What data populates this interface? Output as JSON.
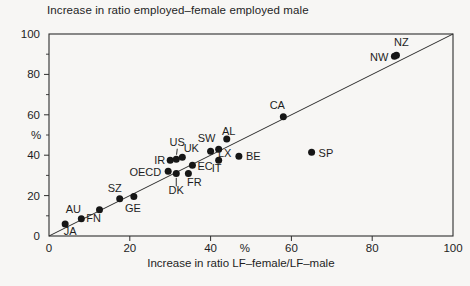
{
  "colors": {
    "ink": "#2e2e2e",
    "dot": "#161616",
    "background": "#f7f6f4"
  },
  "chart_data": {
    "type": "scatter",
    "title": "Increase in ratio employed–female employed male",
    "xlabel": "Increase in ratio LF–female/LF–male",
    "ylabel": "%",
    "x_unit_label": "%",
    "xlim": [
      0,
      100
    ],
    "ylim": [
      0,
      100
    ],
    "x_ticks": [
      0,
      20,
      40,
      60,
      80,
      100
    ],
    "y_ticks": [
      0,
      20,
      40,
      60,
      80,
      100
    ],
    "y_minor_ticks": [
      10,
      30,
      50,
      70,
      90
    ],
    "grid": false,
    "diagonal_line": {
      "from": [
        0,
        0
      ],
      "to": [
        100,
        100
      ]
    },
    "points": [
      {
        "id": "JA",
        "x": 4,
        "y": 6,
        "label": {
          "dx": 5,
          "dy": 11,
          "anchor": "middle"
        }
      },
      {
        "id": "AU",
        "x": 8,
        "y": 8.5,
        "label": {
          "dx": -8,
          "dy": -6,
          "anchor": "middle"
        }
      },
      {
        "id": "FN",
        "x": 12.5,
        "y": 13,
        "label": {
          "dx": -6,
          "dy": 12,
          "anchor": "middle"
        }
      },
      {
        "id": "SZ",
        "x": 17.5,
        "y": 18.5,
        "label": {
          "dx": -5,
          "dy": -7,
          "anchor": "middle"
        }
      },
      {
        "id": "GE",
        "x": 21,
        "y": 19.5,
        "label": {
          "dx": -1,
          "dy": 15,
          "anchor": "middle"
        }
      },
      {
        "id": "OECD",
        "x": 29.5,
        "y": 32,
        "label": {
          "dx": -7,
          "dy": 5,
          "anchor": "end"
        }
      },
      {
        "id": "IR",
        "x": 30,
        "y": 37.5,
        "label": {
          "dx": -5,
          "dy": 4,
          "anchor": "end"
        }
      },
      {
        "id": "US",
        "x": 31.5,
        "y": 38,
        "label": {
          "dx": 1,
          "dy": -13,
          "anchor": "middle"
        },
        "leader": {
          "x1": 1,
          "y1": -10.5,
          "x2": 0.3,
          "y2": -4.5
        }
      },
      {
        "id": "UK",
        "x": 33,
        "y": 39,
        "label": {
          "dx": 9,
          "dy": -5,
          "anchor": "middle"
        }
      },
      {
        "id": "DK",
        "x": 31.5,
        "y": 31,
        "label": {
          "dx": 0,
          "dy": 21,
          "anchor": "middle"
        },
        "leader": {
          "x1": 0,
          "y1": 4.5,
          "x2": 0,
          "y2": 13
        }
      },
      {
        "id": "FR",
        "x": 34.5,
        "y": 31,
        "label": {
          "dx": 6,
          "dy": 13,
          "anchor": "middle"
        }
      },
      {
        "id": "EC",
        "x": 35.5,
        "y": 35,
        "label": {
          "dx": 5,
          "dy": 5,
          "anchor": "start"
        }
      },
      {
        "id": "SW",
        "x": 40,
        "y": 42,
        "label": {
          "dx": -4,
          "dy": -9,
          "anchor": "middle"
        }
      },
      {
        "id": "LX",
        "x": 42,
        "y": 43,
        "label": {
          "dx": 6,
          "dy": 8,
          "anchor": "middle"
        }
      },
      {
        "id": "IT",
        "x": 42,
        "y": 37.5,
        "label": {
          "dx": -2,
          "dy": 12,
          "anchor": "middle"
        }
      },
      {
        "id": "AL",
        "x": 44,
        "y": 48,
        "label": {
          "dx": 2,
          "dy": -4,
          "anchor": "middle"
        }
      },
      {
        "id": "BE",
        "x": 47,
        "y": 39.5,
        "label": {
          "dx": 7,
          "dy": 4,
          "anchor": "start"
        }
      },
      {
        "id": "CA",
        "x": 58,
        "y": 59,
        "label": {
          "dx": -6,
          "dy": -8,
          "anchor": "middle"
        }
      },
      {
        "id": "SP",
        "x": 65,
        "y": 41.5,
        "label": {
          "dx": 7,
          "dy": 5,
          "anchor": "start"
        }
      },
      {
        "id": "NW",
        "x": 85.5,
        "y": 89,
        "label": {
          "dx": -6,
          "dy": 5,
          "anchor": "end"
        }
      },
      {
        "id": "NZ",
        "x": 86,
        "y": 89.5,
        "label": {
          "dx": 5,
          "dy": -9,
          "anchor": "middle"
        }
      }
    ]
  }
}
